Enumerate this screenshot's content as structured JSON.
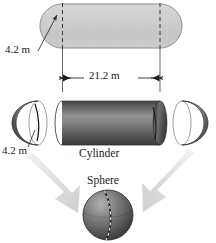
{
  "figure": {
    "labels": {
      "radius_top": "4.2 m",
      "length": "21.2 m",
      "radius_bottom": "4.2 m",
      "cylinder": "Cylinder",
      "sphere": "Sphere"
    },
    "colors": {
      "capsule_fill": "#cfcfcf",
      "capsule_stroke": "#9a9a9a",
      "cylinder_dark": "#4a4a4a",
      "cylinder_light": "#8f8f8f",
      "hemisphere_dark": "#3f3f3f",
      "hemisphere_light": "#9a9a9a",
      "arrow_fill": "#e2e2e2",
      "line": "#2b2b2b",
      "text": "#1a1a1a"
    },
    "parts": [
      {
        "name": "capsule",
        "label": "",
        "shape": "capsule"
      },
      {
        "name": "cylinder",
        "label": "Cylinder",
        "shape": "cylinder"
      },
      {
        "name": "left-hemisphere",
        "label": "",
        "shape": "hemisphere"
      },
      {
        "name": "right-hemisphere",
        "label": "",
        "shape": "hemisphere"
      },
      {
        "name": "sphere",
        "label": "Sphere",
        "shape": "sphere"
      }
    ],
    "dimensions": [
      {
        "name": "radius-top",
        "value": "4.2 m",
        "target": "capsule-radius"
      },
      {
        "name": "length",
        "value": "21.2 m",
        "target": "cylinder-length"
      },
      {
        "name": "radius-bottom",
        "value": "4.2 m",
        "target": "hemisphere-radius"
      }
    ]
  }
}
